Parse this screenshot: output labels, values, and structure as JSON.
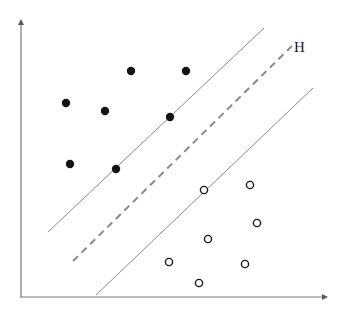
{
  "figure": {
    "type": "svm-margin-diagram",
    "width": 347,
    "height": 319,
    "background": "#ffffff"
  },
  "annotations": {
    "hyperplane_label": "H",
    "hyperplane_label_x": 294,
    "hyperplane_label_y": 40
  },
  "colors": {
    "axis": "#7a7a7a",
    "line": "#8a8a8a",
    "dashed_line": "#8a8a8a",
    "filled_point": "#141414",
    "open_point_stroke": "#1a1a1a",
    "open_point_fill": "#ffffff",
    "label_text": "#1a1a1a"
  },
  "chart_data": {
    "type": "scatter",
    "title": "",
    "xlabel": "",
    "ylabel": "",
    "grid": false,
    "legend": false,
    "axes": {
      "x_axis": {
        "x1": 21,
        "y1": 297,
        "x2": 328,
        "y2": 297,
        "arrow": true
      },
      "y_axis": {
        "x1": 21,
        "y1": 297,
        "x2": 21,
        "y2": 19,
        "arrow": true
      }
    },
    "lines": [
      {
        "name": "upper-margin-line",
        "style": "solid",
        "x1": 48,
        "y1": 232,
        "x2": 264,
        "y2": 28
      },
      {
        "name": "hyperplane-H",
        "style": "dashed",
        "dash": "7,5",
        "x1": 73,
        "y1": 261,
        "x2": 296,
        "y2": 42
      },
      {
        "name": "lower-margin-line",
        "style": "solid",
        "x1": 96,
        "y1": 295,
        "x2": 313,
        "y2": 88
      }
    ],
    "series": [
      {
        "name": "class-positive",
        "marker": "filled-circle",
        "radius": 4.2,
        "points": [
          {
            "x": 131,
            "y": 71,
            "support_vector": false
          },
          {
            "x": 186,
            "y": 71,
            "support_vector": false
          },
          {
            "x": 66,
            "y": 103,
            "support_vector": false
          },
          {
            "x": 105,
            "y": 111,
            "support_vector": false
          },
          {
            "x": 170,
            "y": 117,
            "support_vector": true
          },
          {
            "x": 70,
            "y": 164,
            "support_vector": false
          },
          {
            "x": 116,
            "y": 169,
            "support_vector": true
          }
        ]
      },
      {
        "name": "class-negative",
        "marker": "open-circle",
        "radius": 3.6,
        "points": [
          {
            "x": 204,
            "y": 190,
            "support_vector": true
          },
          {
            "x": 250,
            "y": 185,
            "support_vector": false
          },
          {
            "x": 257,
            "y": 223,
            "support_vector": false
          },
          {
            "x": 208,
            "y": 239,
            "support_vector": false
          },
          {
            "x": 169,
            "y": 262,
            "support_vector": false
          },
          {
            "x": 245,
            "y": 264,
            "support_vector": false
          },
          {
            "x": 199,
            "y": 283,
            "support_vector": false
          }
        ]
      }
    ]
  }
}
